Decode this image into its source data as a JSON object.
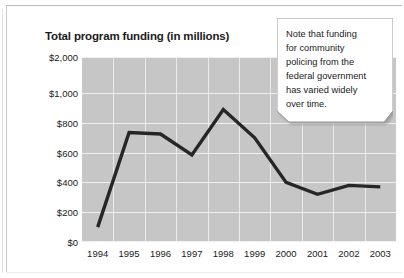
{
  "chart_title": "Total program funding (in millions)",
  "callout": {
    "name": "annotation-callout",
    "lines": [
      "Note that funding",
      "for community",
      "policing from the",
      "federal government",
      "has varied widely",
      "over time."
    ]
  },
  "axis": {
    "y_ticks": [
      "$2,000",
      "$1,000",
      "$800",
      "$600",
      "$400",
      "$200",
      "$0"
    ],
    "y_tick_values": [
      2000,
      1000,
      800,
      600,
      400,
      200,
      0
    ],
    "x_ticks": [
      "1994",
      "1995",
      "1996",
      "1997",
      "1998",
      "1999",
      "2000",
      "2001",
      "2002",
      "2003"
    ]
  },
  "colors": {
    "plot_background": "#c6c6c6",
    "gridline": "#f0f0f0",
    "line": "#262626",
    "text": "#1b1b1b",
    "callout_fill": "#ffffff",
    "callout_border": "#9a9a9a"
  },
  "chart_data": {
    "type": "line",
    "title": "Total program funding (in millions)",
    "xlabel": "",
    "ylabel": "",
    "categories": [
      "1994",
      "1995",
      "1996",
      "1997",
      "1998",
      "1999",
      "2000",
      "2001",
      "2002",
      "2003"
    ],
    "values": [
      100,
      735,
      725,
      585,
      890,
      700,
      400,
      320,
      380,
      370
    ],
    "series": [
      {
        "name": "Total program funding",
        "values": [
          100,
          735,
          725,
          585,
          890,
          700,
          400,
          320,
          380,
          370
        ]
      }
    ],
    "ylim": [
      0,
      2000
    ],
    "y_scale": "piecewise (compressed above $1,000)",
    "y_gridlines": [
      0,
      200,
      400,
      600,
      800,
      1000,
      2000
    ],
    "grid": true,
    "legend": "none",
    "annotations": [
      "Note that funding for community policing from the federal government has varied widely over time."
    ]
  }
}
